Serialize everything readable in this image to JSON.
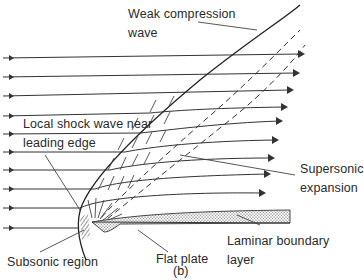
{
  "figure": {
    "caption": "(b)",
    "labels": {
      "weak_compression_wave": [
        "Weak compression",
        "wave"
      ],
      "local_shock_wave": [
        "Local shock wave near",
        "leading edge"
      ],
      "supersonic_expansion": [
        "Supersonic",
        "expansion"
      ],
      "subsonic_region": [
        "Subsonic region"
      ],
      "flat_plate": [
        "Flat plate"
      ],
      "laminar_boundary_layer": [
        "Laminar boundary",
        "layer"
      ]
    },
    "colors": {
      "line": "#333333",
      "text": "#2a2a2a",
      "background": "#ffffff"
    }
  }
}
